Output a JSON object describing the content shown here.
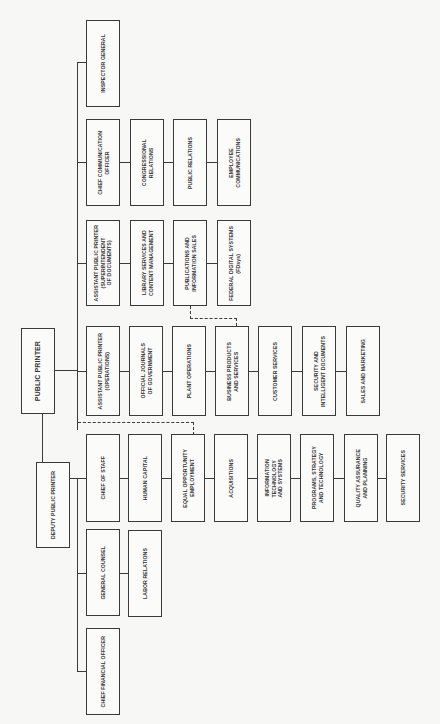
{
  "chart_title": "",
  "orientation": "rotated 90° counter-clockwise",
  "top": {
    "public_printer": "PUBLIC PRINTER",
    "deputy_public_printer": "DEPUTY PUBLIC PRINTER"
  },
  "rows": [
    {
      "head": "INSPECTOR GENERAL",
      "children": []
    },
    {
      "head": "CHIEF COMMUNICATION\nOFFICER",
      "children": [
        "CONGRESSIONAL\nRELATIONS",
        "PUBLIC RELATIONS",
        "EMPLOYEE\nCOMMUNICATIONS"
      ]
    },
    {
      "head": "ASSISTANT PUBLIC PRINTER\n(SUPERINTENDENT\nOF DOCUMENTS)",
      "children": [
        "LIBRARY SERVICES AND\nCONTENT MANAGEMENT",
        "PUBLICATIONS AND\nINFORMATION SALES",
        "FEDERAL DIGITAL SYSTEMS\n(FDsys)"
      ]
    },
    {
      "head": "ASSISTANT PUBLIC PRINTER\n(OPERATIONS)",
      "children": [
        "OFFICIAL JOURNALS\nOF GOVERNMENT",
        "PLANT OPERATIONS",
        "BUSINESS PRODUCTS\nAND SERVICES",
        "CUSTOMER SERVICES",
        "SECURITY AND\nINTELLIGENT DOCUMENTS",
        "SALES AND MARKETING"
      ]
    },
    {
      "head": "CHIEF OF STAFF",
      "children": [
        "HUMAN CAPITAL",
        "EQUAL OPPORTUNITY\nEMPLOYMENT",
        "ACQUISITIONS",
        "INFORMATION\nTECHNOLOGY\nAND SYSTEMS",
        "PROGRAMS, STRATEGY\nAND TECHNOLOGY",
        "QUALITY ASSURANCE\nAND PLANNING",
        "SECURITY SERVICES"
      ]
    },
    {
      "head": "GENERAL COUNSEL",
      "children": [
        "LABOR RELATIONS"
      ]
    },
    {
      "head": "CHIEF FINANCIAL OFFICER",
      "children": []
    }
  ],
  "dotted_links": [
    {
      "from": "PUBLICATIONS AND INFORMATION SALES",
      "to": "BUSINESS PRODUCTS AND SERVICES"
    },
    {
      "from": "DEPUTY PUBLIC PRINTER line",
      "to": "EQUAL OPPORTUNITY EMPLOYMENT"
    }
  ]
}
